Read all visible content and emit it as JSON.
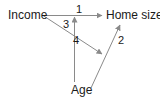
{
  "nodes": {
    "income": {
      "label": "Income"
    },
    "home_size": {
      "label": "Home size"
    },
    "age": {
      "label": "Age"
    }
  },
  "edges": [
    {
      "id": "1",
      "label": "1",
      "from": "Income",
      "to": "Home size"
    },
    {
      "id": "2",
      "label": "2",
      "from": "Age",
      "to": "Home size"
    },
    {
      "id": "3",
      "label": "3",
      "from": "Age",
      "to": "path 1 (Income → Home size)"
    },
    {
      "id": "4",
      "label": "4",
      "from": "Income",
      "to": "path 2 (Age → Home size)"
    }
  ],
  "colors": {
    "line": "#8a8a8a",
    "text": "#1a1a1a"
  }
}
